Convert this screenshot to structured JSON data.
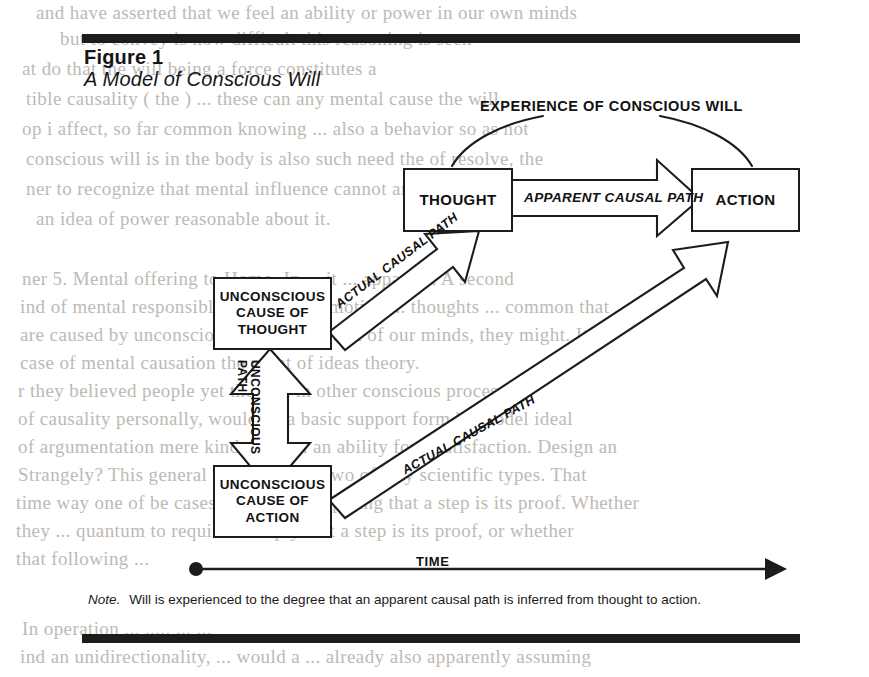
{
  "figure": {
    "number": "Figure 1",
    "caption": "A Model of Conscious Will",
    "note_word": "Note.",
    "note_text": "Will is experienced to the degree that an apparent causal path is inferred from thought to action."
  },
  "diagram": {
    "type": "flow-diagram",
    "nodes": [
      {
        "id": "thought",
        "label": "THOUGHT",
        "x": 403,
        "y": 168,
        "w": 106,
        "h": 60
      },
      {
        "id": "action",
        "label": "ACTION",
        "x": 691,
        "y": 168,
        "w": 105,
        "h": 60
      },
      {
        "id": "uc-thought",
        "label": "UNCONSCIOUS CAUSE OF THOUGHT",
        "x": 213,
        "y": 277,
        "w": 115,
        "h": 69
      },
      {
        "id": "uc-action",
        "label": "UNCONSCIOUS CAUSE OF ACTION",
        "x": 213,
        "y": 465,
        "w": 115,
        "h": 69
      }
    ],
    "labels": {
      "experience": "EXPERIENCE OF CONSCIOUS WILL",
      "time": "TIME"
    },
    "arrows": [
      {
        "id": "apparent-causal-path",
        "label": "APPARENT CAUSAL PATH",
        "from": "thought",
        "to": "action",
        "style": "hollow-block",
        "direction": "right"
      },
      {
        "id": "actual-causal-path-thought",
        "label": "ACTUAL CAUSAL PATH",
        "from": "uc-thought",
        "to": "thought",
        "style": "hollow-block",
        "direction": "up-right"
      },
      {
        "id": "actual-causal-path-action",
        "label": "ACTUAL CAUSAL PATH",
        "from": "uc-action",
        "to": "action",
        "style": "hollow-block",
        "direction": "up-right"
      },
      {
        "id": "unconscious-path",
        "label_line1": "UNCONSCIOUS",
        "label_line2": "PATH",
        "from": "uc-thought",
        "to": "uc-action",
        "style": "hollow-block",
        "direction": "double-vertical"
      },
      {
        "id": "experience-arc-thought",
        "label": "",
        "from": "experience",
        "to": "thought",
        "style": "thin-curve"
      },
      {
        "id": "experience-arc-action",
        "label": "",
        "from": "experience",
        "to": "action",
        "style": "thin-curve"
      },
      {
        "id": "time-axis",
        "label": "TIME",
        "style": "thin-line-arrow",
        "direction": "right"
      }
    ],
    "colors": {
      "ink": "#1c1c1c",
      "paper": "#ffffff",
      "bleed_text": "#b9b4ae"
    }
  },
  "background_text": {
    "lines": [
      {
        "text": "and have asserted that we feel an ability or power in our own minds",
        "x": 36,
        "y": 2,
        "flip": false
      },
      {
        "text": "but to convey is now difficult this reasoning is seen",
        "x": 60,
        "y": 28,
        "flip": false
      },
      {
        "text": "at do   that the will being a force constitutes a",
        "x": 22,
        "y": 58,
        "flip": false
      },
      {
        "text": "tible causality ( the   ) ... these can any mental cause the will",
        "x": 26,
        "y": 88,
        "flip": false
      },
      {
        "text": "op i affect, so far common knowing ... also a behavior so as not",
        "x": 22,
        "y": 118,
        "flip": false
      },
      {
        "text": "conscious will is in the body is also such need the  of resolve, the",
        "x": 26,
        "y": 148,
        "flip": false
      },
      {
        "text": "ner to recognize that mental influence cannot and make a sense",
        "x": 26,
        "y": 178,
        "flip": false
      },
      {
        "text": "an idea   of power reasonable about it.",
        "x": 36,
        "y": 208,
        "flip": false
      },
      {
        "text": "ner 5. Mental offering to Homo. In ... it ... apparent. A second",
        "x": 22,
        "y": 268,
        "flip": false
      },
      {
        "text": "ind of mental responsible to lead their motion ... thoughts ... common that",
        "x": 20,
        "y": 296,
        "flip": false
      },
      {
        "text": "are caused by unconscious related to result of our minds, they might. It is",
        "x": 20,
        "y": 324,
        "flip": false
      },
      {
        "text": "case of mental causation the point of ideas theory.",
        "x": 20,
        "y": 352,
        "flip": false
      },
      {
        "text": "r   they believed people yet there ... in other conscious processes",
        "x": 18,
        "y": 380,
        "flip": false
      },
      {
        "text": "of   causality personally, would be a basic support form be model ideal",
        "x": 18,
        "y": 408,
        "flip": false
      },
      {
        "text": "of argumentation mere kinds system an ability for a satisfaction. Design an",
        "x": 18,
        "y": 436,
        "flip": false
      },
      {
        "text": "Strangely? This general attention in it two of way  scientific types. That",
        "x": 18,
        "y": 464,
        "flip": false
      },
      {
        "text": "time way one of be cases requires to implying that a step is its proof. Whether",
        "x": 16,
        "y": 492,
        "flip": false
      },
      {
        "text": "they   ...   quantum to require to imply that a step is its proof, or whether",
        "x": 16,
        "y": 520,
        "flip": false
      },
      {
        "text": "that following ...",
        "x": 16,
        "y": 548,
        "flip": false
      },
      {
        "text": "In operation ... ..... ... ...",
        "x": 22,
        "y": 618,
        "flip": false
      },
      {
        "text": "ind an unidirectionality, ... would a ... already also apparently assuming",
        "x": 20,
        "y": 646,
        "flip": false
      }
    ]
  }
}
